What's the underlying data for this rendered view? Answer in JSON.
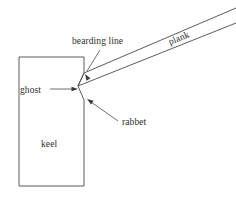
{
  "diagram": {
    "background_color": "#ffffff",
    "line_color": "#4a4a4a",
    "text_color": "#2e2e2e",
    "labels": {
      "bearding_line": "bearding line",
      "plank": "plank",
      "ghost": "ghost",
      "rabbet": "rabbet",
      "keel": "keel"
    },
    "label_positions": {
      "bearding_line": {
        "x": 72,
        "y": 44,
        "rotation": 0
      },
      "plank": {
        "x": 170,
        "y": 45,
        "rotation": -22
      },
      "ghost": {
        "x": 20,
        "y": 93,
        "rotation": 0
      },
      "rabbet": {
        "x": 122,
        "y": 125,
        "rotation": 0
      },
      "keel": {
        "x": 41,
        "y": 147,
        "rotation": 0
      }
    },
    "shapes": {
      "keel_outline": "M19,57 L84,57 L84,73 L78,86 L84,100 L84,186 L19,186 Z",
      "plank_upper_edge": "M84,73 L236,8",
      "plank_lower_edge": "M78,86 L236,23",
      "plank_butt_end": "M84,73 L78,86"
    },
    "leaders": [
      {
        "name": "bearding-line-leader",
        "path": "M100,50 L87,71",
        "arrow_tip": {
          "x": 85,
          "y": 74
        },
        "arrow_angle": 238
      },
      {
        "name": "ghost-leader",
        "path": "M50,89 L73,89",
        "arrow_tip": {
          "x": 78,
          "y": 89
        },
        "arrow_angle": 0
      },
      {
        "name": "rabbet-leader",
        "path": "M118,121 L91,102",
        "arrow_tip": {
          "x": 87,
          "y": 99
        },
        "arrow_angle": 215
      }
    ]
  }
}
